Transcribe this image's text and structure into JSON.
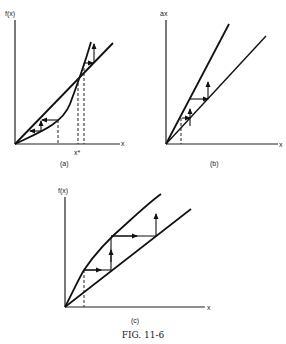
{
  "figure": {
    "caption": "FIG. 11-6",
    "panels": [
      {
        "id": "a",
        "label": "(a)",
        "y_axis_label": "f(x)",
        "x_axis_label": "x",
        "marker_label": "x*"
      },
      {
        "id": "b",
        "label": "(b)",
        "y_axis_label": "ax",
        "x_axis_label": "x"
      },
      {
        "id": "c",
        "label": "(c)",
        "y_axis_label": "f(x)",
        "x_axis_label": "x"
      }
    ]
  }
}
